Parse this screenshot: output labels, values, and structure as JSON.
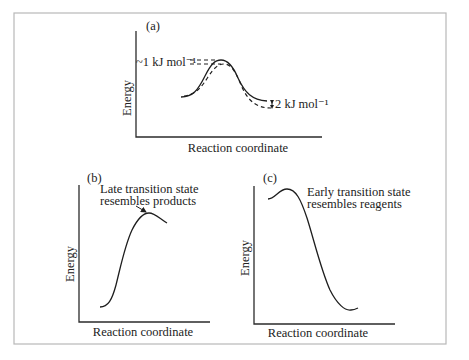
{
  "figure": {
    "frame_color": "#b8b8b8",
    "ink_color": "#222222",
    "panels": [
      {
        "id": "a",
        "label": "(a)",
        "ylabel": "Energy",
        "xlabel": "Reaction coordinate",
        "annotations": {
          "barrier_diff": "~1 kJ mol⁻¹",
          "product_diff": "2 kJ mol⁻¹"
        },
        "curves": [
          "solid reaction profile",
          "dashed reaction profile (lower by ~1 kJ/mol at TS, 2 kJ/mol at products)"
        ]
      },
      {
        "id": "b",
        "label": "(b)",
        "ylabel": "Energy",
        "xlabel": "Reaction coordinate",
        "annotation_line1": "Late transition state",
        "annotation_line2": "resembles products",
        "curves": [
          "endothermic profile with late transition state"
        ]
      },
      {
        "id": "c",
        "label": "(c)",
        "ylabel": "Energy",
        "xlabel": "Reaction coordinate",
        "annotation_line1": "Early transition state",
        "annotation_line2": "resembles reagents",
        "curves": [
          "exothermic profile with early transition state"
        ]
      }
    ]
  }
}
